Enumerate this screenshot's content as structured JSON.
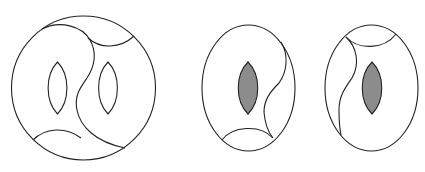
{
  "diagram": {
    "colors": {
      "stroke": "#222222",
      "background": "#ffffff",
      "lens_fill": "#8c8c8c"
    },
    "figures": [
      {
        "id": "figure-1",
        "shape": "circle",
        "lenses": [
          {
            "position": "left",
            "filled": false
          },
          {
            "position": "right",
            "filled": false
          }
        ],
        "features": [
          "top-right cap arc",
          "bottom-left cap arc",
          "S-shaped dividing curve"
        ]
      },
      {
        "id": "figure-2",
        "shape": "ellipse",
        "lenses": [
          {
            "position": "center",
            "filled": true
          }
        ],
        "features": [
          "bottom cap arc",
          "right S-shaped curve"
        ]
      },
      {
        "id": "figure-3",
        "shape": "ellipse",
        "lenses": [
          {
            "position": "center",
            "filled": true
          }
        ],
        "features": [
          "top cap arc",
          "left S-shaped curve"
        ]
      }
    ]
  }
}
